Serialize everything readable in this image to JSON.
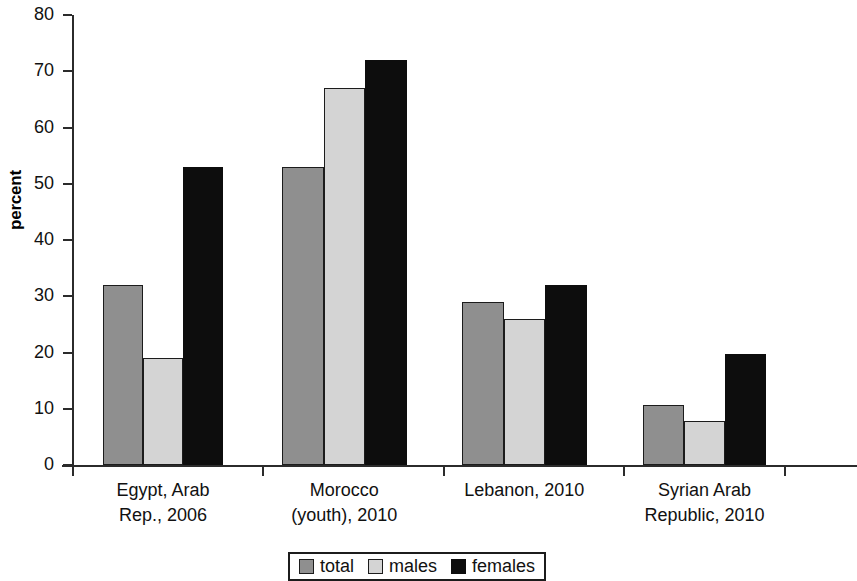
{
  "chart_data": {
    "type": "bar",
    "title": "",
    "xlabel": "",
    "ylabel": "percent",
    "ylim": [
      0,
      80
    ],
    "yticks": [
      0,
      10,
      20,
      30,
      40,
      50,
      60,
      70,
      80
    ],
    "grid": false,
    "legend_position": "bottom",
    "categories": [
      "Egypt, Arab Rep., 2006",
      "Morocco (youth), 2010",
      "Lebanon, 2010",
      "Syrian Arab Republic, 2010"
    ],
    "category_lines": [
      [
        "Egypt, Arab",
        "Rep., 2006"
      ],
      [
        "Morocco",
        "(youth), 2010"
      ],
      [
        "Lebanon, 2010",
        ""
      ],
      [
        "Syrian Arab",
        "Republic, 2010"
      ]
    ],
    "series": [
      {
        "name": "total",
        "color": "#8f8f8f",
        "values": [
          32,
          53,
          29,
          10.7
        ]
      },
      {
        "name": "males",
        "color": "#d4d4d4",
        "values": [
          19,
          67,
          26,
          7.8
        ]
      },
      {
        "name": "females",
        "color": "#0d0d0d",
        "values": [
          53,
          72,
          32,
          19.7
        ]
      }
    ]
  },
  "axis": {
    "y_label": "percent",
    "y_tick_labels": [
      "80",
      "70",
      "60",
      "50",
      "40",
      "30",
      "20",
      "10",
      "0"
    ]
  },
  "legend": {
    "items": [
      {
        "label": "total"
      },
      {
        "label": "males"
      },
      {
        "label": "females"
      }
    ]
  }
}
